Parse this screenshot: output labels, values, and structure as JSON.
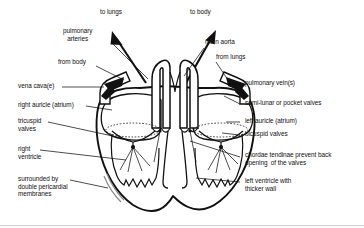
{
  "figure": {
    "background_color": "#ffffff",
    "ink_color": "#111111"
  },
  "labels": {
    "to_lungs": "to lungs",
    "to_body": "to body",
    "pulmonary_arteries": "pulmonary\narteries",
    "main_aorta": "main aorta",
    "from_body": "from body",
    "from_lungs": "from lungs",
    "vena_cavae": "vena cava(e)",
    "pulmonary_veins": "pulmonary vein(s)",
    "right_auricle": "right auricle (atrium)",
    "semi_lunar_valves": "semi-lunar or pocket valves",
    "tricuspid_valves": "tricuspid\nvalves",
    "left_auricle": "left auricle (atrium)",
    "bicuspid_valves": "bicuspid valves",
    "right_ventricle": "right\nventricle",
    "chordae_tendinae": "chordae tendinae prevent back\nopening  of the valves",
    "left_ventricle": "left ventricle with\nthicker wall",
    "pericardial_membranes": "surrounded by\ndouble pericardial\nmembranes"
  },
  "label_items": [
    {
      "key": "to_lungs",
      "text": "to lungs",
      "x": 100,
      "y": 11,
      "align": "left",
      "lines": 1
    },
    {
      "key": "to_body",
      "text": "to body",
      "x": 190,
      "y": 11,
      "align": "left",
      "lines": 1
    },
    {
      "key": "pulmonary_arteries",
      "text": "pulmonary\narteries",
      "x": 63,
      "y": 29,
      "align": "left",
      "lines": 2
    },
    {
      "key": "main_aorta",
      "text": "main aorta",
      "x": 205,
      "y": 40,
      "align": "left",
      "lines": 1
    },
    {
      "key": "from_body",
      "text": "from body",
      "x": 60,
      "y": 62,
      "align": "left",
      "lines": 1
    },
    {
      "key": "from_lungs",
      "text": "from lungs",
      "x": 216,
      "y": 57,
      "align": "left",
      "lines": 1
    },
    {
      "key": "vena_cavae",
      "text": "vena cava(e)",
      "x": 18,
      "y": 85,
      "align": "left",
      "lines": 1
    },
    {
      "key": "pulmonary_veins",
      "text": "pulmonary vein(s)",
      "x": 243,
      "y": 82,
      "align": "left",
      "lines": 1
    },
    {
      "key": "right_auricle",
      "text": "right auricle (atrium)",
      "x": 18,
      "y": 104,
      "align": "left",
      "lines": 1
    },
    {
      "key": "semi_lunar_valves",
      "text": "semi-lunar or pocket valves",
      "x": 243,
      "y": 102,
      "align": "left",
      "lines": 1
    },
    {
      "key": "tricuspid_valves",
      "text": "tricuspid\nvalves",
      "x": 18,
      "y": 120,
      "align": "left",
      "lines": 2
    },
    {
      "key": "left_auricle",
      "text": "left auricle (atrium)",
      "x": 243,
      "y": 120,
      "align": "left",
      "lines": 1
    },
    {
      "key": "bicuspid_valves",
      "text": "bicuspid valves",
      "x": 243,
      "y": 133,
      "align": "left",
      "lines": 1
    },
    {
      "key": "right_ventricle",
      "text": "right\nventricle",
      "x": 18,
      "y": 148,
      "align": "left",
      "lines": 2
    },
    {
      "key": "chordae_tendinae",
      "text": "chordae tendinae prevent back\nopening  of the valves",
      "x": 243,
      "y": 154,
      "align": "left",
      "lines": 2
    },
    {
      "key": "left_ventricle",
      "text": "left ventricle with\nthicker wall",
      "x": 243,
      "y": 180,
      "align": "left",
      "lines": 2
    },
    {
      "key": "pericardial_membranes",
      "text": "surrounded by\ndouble pericardial\nmembranes",
      "x": 18,
      "y": 178,
      "align": "left",
      "lines": 3
    }
  ],
  "structures": [
    {
      "name": "pulmonary-artery-trunk",
      "side": "center-left",
      "flow": "out"
    },
    {
      "name": "aorta-trunk",
      "side": "center-right",
      "flow": "out"
    },
    {
      "name": "vena-cava",
      "side": "left",
      "flow": "in"
    },
    {
      "name": "pulmonary-vein",
      "side": "right",
      "flow": "in"
    },
    {
      "name": "right-atrium",
      "side": "left",
      "flow": "chamber"
    },
    {
      "name": "left-atrium",
      "side": "right",
      "flow": "chamber"
    },
    {
      "name": "right-ventricle",
      "side": "left",
      "flow": "chamber"
    },
    {
      "name": "left-ventricle",
      "side": "right",
      "flow": "chamber"
    },
    {
      "name": "tricuspid-valve",
      "side": "left",
      "flow": "valve"
    },
    {
      "name": "bicuspid-valve",
      "side": "right",
      "flow": "valve"
    },
    {
      "name": "semi-lunar-valves",
      "side": "center",
      "flow": "valve"
    },
    {
      "name": "chordae-tendinae",
      "side": "both",
      "flow": "tendon"
    },
    {
      "name": "pericardial-membranes",
      "side": "left-bottom",
      "flow": "membrane"
    }
  ],
  "flow_arrows": [
    {
      "name": "to-lungs-arrow",
      "direction": "up-left",
      "meaning": "blood leaves to lungs"
    },
    {
      "name": "to-body-arrow",
      "direction": "up-right",
      "meaning": "blood leaves to body"
    },
    {
      "name": "from-body-arrow",
      "direction": "down-right",
      "meaning": "blood enters from body"
    },
    {
      "name": "from-lungs-arrow",
      "direction": "down-left",
      "meaning": "blood enters from lungs"
    }
  ]
}
